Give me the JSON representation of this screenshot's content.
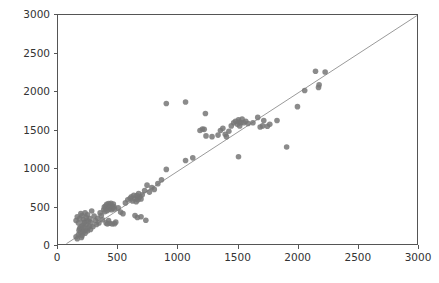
{
  "chart_data": {
    "type": "scatter",
    "title": "",
    "subtitle": "",
    "xlabel": "",
    "ylabel": "",
    "xlim": [
      0,
      3000
    ],
    "ylim": [
      0,
      3000
    ],
    "xticks": [
      0,
      500,
      1000,
      1500,
      2000,
      2500,
      3000
    ],
    "yticks": [
      0,
      500,
      1000,
      1500,
      2000,
      2500,
      3000
    ],
    "xtick_labels": [
      "0",
      "500",
      "1000",
      "1500",
      "2000",
      "2500",
      "3000"
    ],
    "ytick_labels": [
      "0",
      "500",
      "1000",
      "1500",
      "2000",
      "2500",
      "3000"
    ],
    "grid": false,
    "legend": null,
    "annotations": [],
    "marker": {
      "shape": "circle",
      "color": "#777777",
      "opacity": 0.85,
      "size_px": 5.6
    },
    "reference_line": {
      "label": "identity-line",
      "color": "#9a9a9a",
      "width_px": 1.0,
      "x": [
        70,
        3000
      ],
      "y": [
        30,
        3010
      ]
    },
    "series": [
      {
        "name": "observations",
        "points": [
          [
            150,
            120
          ],
          [
            160,
            95
          ],
          [
            170,
            150
          ],
          [
            175,
            205
          ],
          [
            180,
            230
          ],
          [
            185,
            175
          ],
          [
            190,
            250
          ],
          [
            195,
            110
          ],
          [
            200,
            135
          ],
          [
            200,
            215
          ],
          [
            205,
            265
          ],
          [
            210,
            180
          ],
          [
            215,
            240
          ],
          [
            220,
            310
          ],
          [
            225,
            165
          ],
          [
            230,
            205
          ],
          [
            235,
            280
          ],
          [
            240,
            330
          ],
          [
            245,
            195
          ],
          [
            250,
            235
          ],
          [
            150,
            330
          ],
          [
            160,
            380
          ],
          [
            170,
            300
          ],
          [
            180,
            355
          ],
          [
            190,
            420
          ],
          [
            200,
            395
          ],
          [
            210,
            345
          ],
          [
            215,
            300
          ],
          [
            225,
            430
          ],
          [
            235,
            370
          ],
          [
            245,
            405
          ],
          [
            255,
            320
          ],
          [
            260,
            260
          ],
          [
            265,
            355
          ],
          [
            270,
            215
          ],
          [
            275,
            300
          ],
          [
            280,
            455
          ],
          [
            290,
            250
          ],
          [
            300,
            390
          ],
          [
            310,
            330
          ],
          [
            320,
            280
          ],
          [
            330,
            360
          ],
          [
            340,
            300
          ],
          [
            350,
            430
          ],
          [
            360,
            395
          ],
          [
            370,
            340
          ],
          [
            380,
            470
          ],
          [
            385,
            505
          ],
          [
            390,
            445
          ],
          [
            395,
            520
          ],
          [
            400,
            490
          ],
          [
            405,
            540
          ],
          [
            410,
            460
          ],
          [
            415,
            515
          ],
          [
            420,
            550
          ],
          [
            425,
            480
          ],
          [
            430,
            500
          ],
          [
            435,
            530
          ],
          [
            440,
            555
          ],
          [
            445,
            470
          ],
          [
            450,
            520
          ],
          [
            455,
            495
          ],
          [
            460,
            545
          ],
          [
            465,
            510
          ],
          [
            470,
            480
          ],
          [
            400,
            300
          ],
          [
            410,
            285
          ],
          [
            420,
            330
          ],
          [
            430,
            295
          ],
          [
            450,
            285
          ],
          [
            470,
            290
          ],
          [
            480,
            310
          ],
          [
            500,
            495
          ],
          [
            520,
            440
          ],
          [
            540,
            420
          ],
          [
            560,
            560
          ],
          [
            580,
            600
          ],
          [
            600,
            620
          ],
          [
            610,
            640
          ],
          [
            620,
            585
          ],
          [
            630,
            660
          ],
          [
            640,
            610
          ],
          [
            650,
            575
          ],
          [
            655,
            655
          ],
          [
            660,
            625
          ],
          [
            665,
            600
          ],
          [
            670,
            680
          ],
          [
            680,
            640
          ],
          [
            690,
            610
          ],
          [
            700,
            665
          ],
          [
            640,
            395
          ],
          [
            660,
            370
          ],
          [
            690,
            380
          ],
          [
            730,
            335
          ],
          [
            720,
            720
          ],
          [
            740,
            790
          ],
          [
            760,
            700
          ],
          [
            780,
            760
          ],
          [
            800,
            735
          ],
          [
            830,
            810
          ],
          [
            860,
            860
          ],
          [
            900,
            1850
          ],
          [
            900,
            995
          ],
          [
            1060,
            1110
          ],
          [
            1060,
            1870
          ],
          [
            1120,
            1145
          ],
          [
            1180,
            1500
          ],
          [
            1200,
            1520
          ],
          [
            1215,
            1515
          ],
          [
            1225,
            1720
          ],
          [
            1230,
            1430
          ],
          [
            1280,
            1420
          ],
          [
            1330,
            1440
          ],
          [
            1350,
            1500
          ],
          [
            1370,
            1530
          ],
          [
            1390,
            1450
          ],
          [
            1400,
            1420
          ],
          [
            1420,
            1490
          ],
          [
            1440,
            1560
          ],
          [
            1460,
            1600
          ],
          [
            1475,
            1620
          ],
          [
            1490,
            1580
          ],
          [
            1500,
            1640
          ],
          [
            1505,
            1610
          ],
          [
            1510,
            1560
          ],
          [
            1520,
            1600
          ],
          [
            1530,
            1650
          ],
          [
            1545,
            1600
          ],
          [
            1560,
            1620
          ],
          [
            1580,
            1590
          ],
          [
            1500,
            1160
          ],
          [
            1620,
            1600
          ],
          [
            1660,
            1670
          ],
          [
            1680,
            1545
          ],
          [
            1700,
            1560
          ],
          [
            1710,
            1630
          ],
          [
            1740,
            1555
          ],
          [
            1760,
            1580
          ],
          [
            1820,
            1630
          ],
          [
            1900,
            1285
          ],
          [
            1990,
            1810
          ],
          [
            2050,
            2020
          ],
          [
            2140,
            2270
          ],
          [
            2165,
            2060
          ],
          [
            2170,
            2095
          ],
          [
            2220,
            2260
          ]
        ]
      }
    ]
  }
}
